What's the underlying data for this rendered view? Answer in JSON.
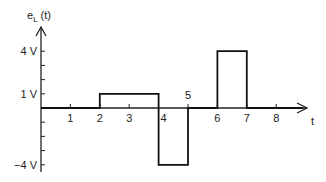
{
  "chart_data": {
    "type": "line",
    "title": "",
    "ylabel": "e",
    "ylabel_sub": "L",
    "ylabel_arg": "(t)",
    "xlabel": "t",
    "xlim": [
      0,
      8.9
    ],
    "ylim": [
      -4.3,
      4.7
    ],
    "x_ticks": [
      1,
      2,
      3,
      4,
      5,
      6,
      7,
      8
    ],
    "x_tick_labels": [
      "1",
      "2",
      "3",
      "4",
      "5",
      "6",
      "7",
      "8"
    ],
    "y_ticks": [
      -4,
      -3,
      -2,
      -1,
      1,
      2,
      3,
      4
    ],
    "y_tick_labels": [
      {
        "value": 4,
        "label": "4 V"
      },
      {
        "value": 1,
        "label": "1 V"
      },
      {
        "value": -4,
        "label": "-4 V"
      }
    ],
    "series": [
      {
        "name": "e_L(t)",
        "step": true,
        "points": [
          [
            0,
            0
          ],
          [
            2,
            0
          ],
          [
            2,
            1
          ],
          [
            4,
            1
          ],
          [
            4,
            -4
          ],
          [
            5,
            -4
          ],
          [
            5,
            0
          ],
          [
            6,
            0
          ],
          [
            6,
            4
          ],
          [
            7,
            4
          ],
          [
            7,
            0
          ],
          [
            8.9,
            0
          ]
        ]
      }
    ],
    "grid": false,
    "legend": "none"
  }
}
